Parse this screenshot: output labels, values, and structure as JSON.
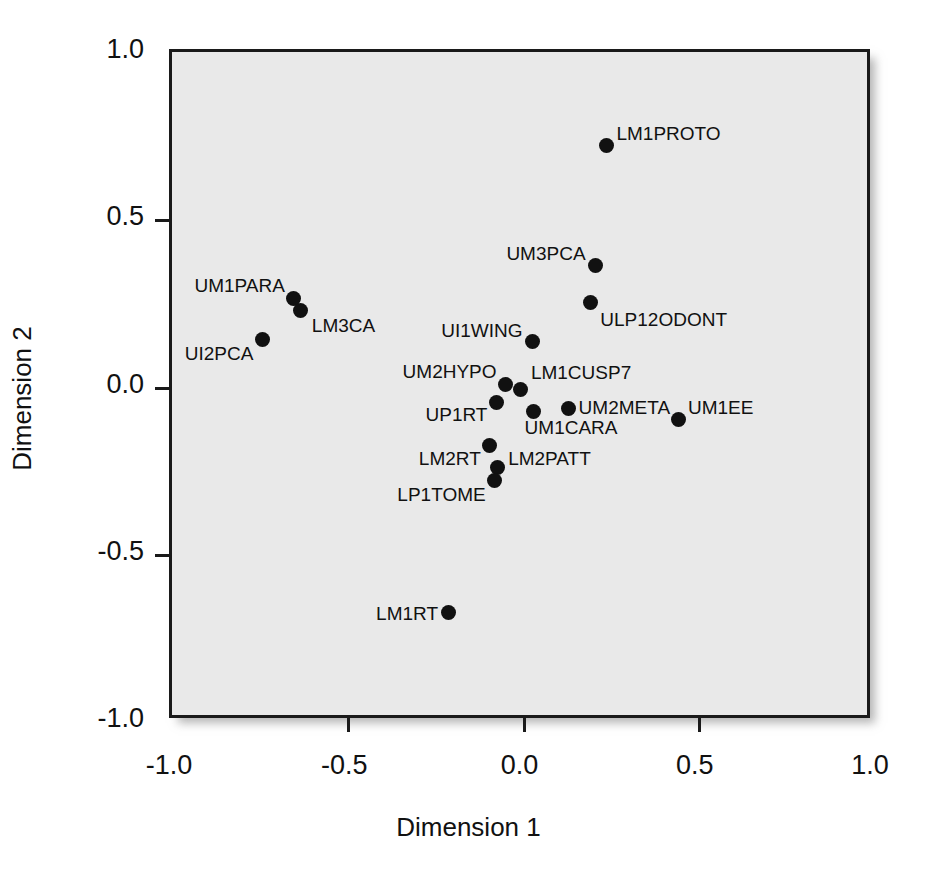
{
  "chart_data": {
    "type": "scatter",
    "title": "",
    "xlabel": "Dimension 1",
    "ylabel": "Dimension 2",
    "xlim": [
      -1.0,
      1.0
    ],
    "ylim": [
      -1.0,
      1.0
    ],
    "xticks": [
      "-1.0",
      "-0.5",
      "0.0",
      "0.5",
      "1.0"
    ],
    "xtick_values": [
      -1.0,
      -0.5,
      0.0,
      0.5,
      1.0
    ],
    "yticks": [
      "1.0",
      "0.5",
      "0.0",
      "-0.5",
      "-1.0"
    ],
    "ytick_values": [
      1.0,
      0.5,
      0.0,
      -0.5,
      -1.0
    ],
    "grid": false,
    "legend": "none",
    "plot_background": "#e9e9e9",
    "point_color": "#111111",
    "points": [
      {
        "label": "LM1PROTO",
        "x": 0.241,
        "y": 0.721,
        "lpos": "r",
        "lx": 0.268,
        "ly": 0.757
      },
      {
        "label": "UM3PCA",
        "x": 0.207,
        "y": 0.362,
        "lpos": "l",
        "lx": 0.18,
        "ly": 0.398
      },
      {
        "label": "ULP12ODONT",
        "x": 0.193,
        "y": 0.251,
        "lpos": "r",
        "lx": 0.222,
        "ly": 0.203
      },
      {
        "label": "UM1PARA",
        "x": -0.652,
        "y": 0.263,
        "lpos": "l",
        "lx": -0.678,
        "ly": 0.302
      },
      {
        "label": "LM3CA",
        "x": -0.632,
        "y": 0.227,
        "lpos": "r",
        "lx": -0.601,
        "ly": 0.185
      },
      {
        "label": "UI2PCA",
        "x": -0.741,
        "y": 0.14,
        "lpos": "l",
        "lx": -0.768,
        "ly": 0.101
      },
      {
        "label": "UI1WING",
        "x": 0.029,
        "y": 0.135,
        "lpos": "l",
        "lx": 0.0,
        "ly": 0.17
      },
      {
        "label": "UM2HYPO",
        "x": -0.048,
        "y": 0.006,
        "lpos": "l",
        "lx": -0.074,
        "ly": 0.045
      },
      {
        "label": "LM1CUSP7",
        "x": -0.005,
        "y": -0.009,
        "lpos": "r",
        "lx": 0.024,
        "ly": 0.042
      },
      {
        "label": "UP1RT",
        "x": -0.073,
        "y": -0.048,
        "lpos": "l",
        "lx": -0.1,
        "ly": -0.083
      },
      {
        "label": "UM1CARA",
        "x": 0.03,
        "y": -0.075,
        "lpos": "r",
        "lx": 0.006,
        "ly": -0.122
      },
      {
        "label": "UM2META",
        "x": 0.13,
        "y": -0.066,
        "lpos": "r",
        "lx": 0.16,
        "ly": -0.06
      },
      {
        "label": "UM1EE",
        "x": 0.444,
        "y": -0.1,
        "lpos": "r",
        "lx": 0.472,
        "ly": -0.06
      },
      {
        "label": "LM2RT",
        "x": -0.093,
        "y": -0.177,
        "lpos": "l",
        "lx": -0.119,
        "ly": -0.213
      },
      {
        "label": "LM2PATT",
        "x": -0.07,
        "y": -0.243,
        "lpos": "r",
        "lx": -0.041,
        "ly": -0.213
      },
      {
        "label": "LP1TOME",
        "x": -0.079,
        "y": -0.282,
        "lpos": "l",
        "lx": -0.105,
        "ly": -0.321
      },
      {
        "label": "LM1RT",
        "x": -0.212,
        "y": -0.676,
        "lpos": "l",
        "lx": -0.241,
        "ly": -0.676
      }
    ]
  }
}
